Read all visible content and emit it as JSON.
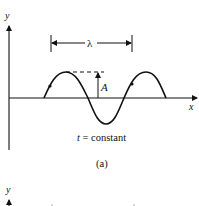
{
  "figure_a": {
    "y_axis_label": "y",
    "x_axis_label": "x",
    "wavelength_label": "λ",
    "amplitude_label": "A",
    "condition_label_var": "t",
    "condition_label_rest": " = constant",
    "caption": "(a)"
  },
  "figure_b_partial": {
    "y_axis_label": "y"
  },
  "colors": {
    "ink": "#111111",
    "background": "#ffffff"
  }
}
